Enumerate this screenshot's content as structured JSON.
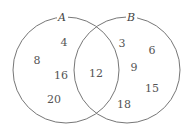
{
  "diagram": {
    "type": "venn",
    "sets": [
      {
        "label": "A",
        "circle": {
          "cx": 66,
          "cy": 70,
          "r": 53
        },
        "label_pos": {
          "x": 62,
          "y": 21
        }
      },
      {
        "label": "B",
        "circle": {
          "cx": 127,
          "cy": 70,
          "r": 53
        },
        "label_pos": {
          "x": 131,
          "y": 21
        }
      }
    ],
    "regions": {
      "A_only": [
        "4",
        "8",
        "16",
        "20"
      ],
      "A_and_B": [
        "12"
      ],
      "B_only": [
        "3",
        "6",
        "9",
        "15",
        "18"
      ]
    },
    "numbers": [
      {
        "value": "4",
        "x": 64,
        "y": 17,
        "region": "A_only"
      },
      {
        "value": "8",
        "x": 37,
        "y": 36,
        "region": "A_only"
      },
      {
        "value": "16",
        "x": 61,
        "y": 50,
        "region": "A_only"
      },
      {
        "value": "20",
        "x": 54,
        "y": 74,
        "region": "A_only"
      },
      {
        "value": "12",
        "x": 96,
        "y": 49,
        "region": "A_and_B"
      },
      {
        "value": "3",
        "x": 122,
        "y": 17,
        "region": "B_only"
      },
      {
        "value": "6",
        "x": 152,
        "y": 25,
        "region": "B_only"
      },
      {
        "value": "9",
        "x": 134,
        "y": 42,
        "region": "B_only"
      },
      {
        "value": "15",
        "x": 152,
        "y": 63,
        "region": "B_only"
      },
      {
        "value": "18",
        "x": 124,
        "y": 79,
        "region": "B_only"
      }
    ],
    "stroke_color": "#666666"
  }
}
